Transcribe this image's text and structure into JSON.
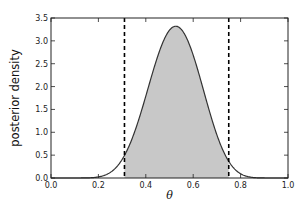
{
  "chart_data": {
    "type": "area",
    "title": "",
    "xlabel": "θ",
    "ylabel": "posterior density",
    "xlim": [
      0.0,
      1.0
    ],
    "ylim": [
      0.0,
      3.5
    ],
    "xticks": [
      "0.0",
      "0.2",
      "0.4",
      "0.6",
      "0.8",
      "1.0"
    ],
    "yticks": [
      "0.0",
      "0.5",
      "1.0",
      "1.5",
      "2.0",
      "2.5",
      "3.0",
      "3.5"
    ],
    "grid": false,
    "legend": "none",
    "curve": {
      "name": "posterior density",
      "distribution": "beta",
      "alpha": 11,
      "beta": 10,
      "mode_x": 0.53,
      "peak_y": 3.32,
      "color": "#333333"
    },
    "interval": {
      "lower": 0.31,
      "upper": 0.75,
      "fill_color": "#c8c8c8",
      "line_style": "dashed",
      "line_color": "#000000"
    }
  }
}
